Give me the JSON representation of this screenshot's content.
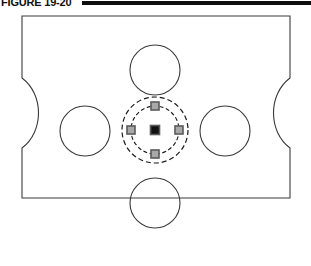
{
  "caption": {
    "label": "FIGURE 19-20",
    "rule_color": "#0d0d0d"
  },
  "drawing": {
    "title": "machined plate with bolt circle detail",
    "line_color": "#3a3a3a",
    "dash_color": "#1a1a1a",
    "marker_fill": "#a8a8a8",
    "marker_stroke": "#5a5a5a",
    "center_marker_fill": "#111111",
    "background": "#ffffff",
    "outline": {
      "name": "plate-outline",
      "left": 22,
      "top": 4,
      "right": 290,
      "bottom": 186,
      "notch_top_y": 66,
      "notch_bottom_y": 136,
      "notch_depth": 22,
      "corner_chamfer": 0
    },
    "holes": [
      {
        "name": "hole-top",
        "cx": 155,
        "cy": 58,
        "r": 25
      },
      {
        "name": "hole-left",
        "cx": 85,
        "cy": 119,
        "r": 25
      },
      {
        "name": "hole-right",
        "cx": 225,
        "cy": 119,
        "r": 25
      },
      {
        "name": "hole-bottom",
        "cx": 155,
        "cy": 191,
        "r": 25
      }
    ],
    "bolt_circle": {
      "cx": 155,
      "cy": 118,
      "outer_r": 33,
      "inner_r": 24,
      "outer_dash": "5 3",
      "inner_dash": "4 2.5"
    },
    "markers": [
      {
        "name": "marker-north",
        "cx": 155,
        "cy": 94,
        "size": 8
      },
      {
        "name": "marker-east",
        "cx": 179,
        "cy": 118,
        "size": 8
      },
      {
        "name": "marker-south",
        "cx": 155,
        "cy": 142,
        "size": 8
      },
      {
        "name": "marker-west",
        "cx": 131,
        "cy": 118,
        "size": 8
      }
    ],
    "center_marker": {
      "name": "marker-center",
      "cx": 155,
      "cy": 118,
      "size": 9
    }
  }
}
